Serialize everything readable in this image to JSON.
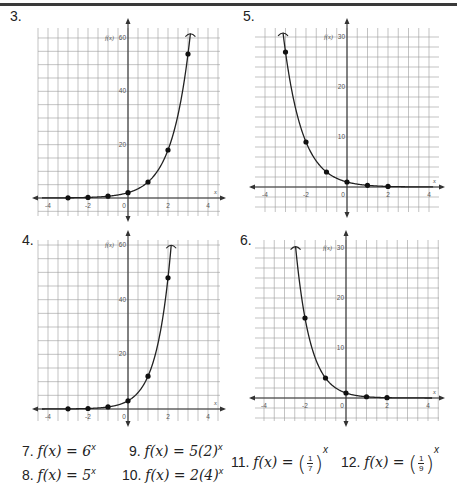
{
  "problems": [
    {
      "num": "3.",
      "label_x": 10,
      "label_y": 10
    },
    {
      "num": "5.",
      "label_x": 243,
      "label_y": 10
    },
    {
      "num": "4.",
      "label_x": 22,
      "label_y": 232
    },
    {
      "num": "6.",
      "label_x": 240,
      "label_y": 232
    }
  ],
  "equations": [
    {
      "num": "7.",
      "lhs": "f(x) = 6",
      "exp": "x"
    },
    {
      "num": "8.",
      "lhs": "f(x) = 5",
      "exp": "x"
    },
    {
      "num": "9.",
      "lhs": "f(x) = 5(2)",
      "exp": "x"
    },
    {
      "num": "10.",
      "lhs": "f(x) = 2(4)",
      "exp": "x"
    },
    {
      "num": "11.",
      "lhs": "f(x) =",
      "frac_num": "1",
      "frac_den": "7",
      "exp": "x"
    },
    {
      "num": "12.",
      "lhs": "f(x) =",
      "frac_num": "1",
      "frac_den": "9",
      "exp": "x"
    }
  ],
  "chart_data": [
    {
      "id": "graph-3",
      "type": "line",
      "title": "3.",
      "xlabel": "x",
      "ylabel": "f(x)",
      "x_ticks": [
        "-4",
        "-2",
        "0",
        "2",
        "4"
      ],
      "y_ticks": [
        "20",
        "40",
        "60"
      ],
      "xlim": [
        -4,
        4
      ],
      "ylim": [
        0,
        60
      ],
      "points": [
        [
          -3,
          0.07
        ],
        [
          -2,
          0.22
        ],
        [
          -1,
          0.67
        ],
        [
          0,
          2
        ],
        [
          1,
          6
        ],
        [
          2,
          18
        ],
        [
          3,
          54
        ]
      ],
      "curve": {
        "a": 2,
        "b": 3
      },
      "box": {
        "left": 38,
        "right": 220,
        "top": 28,
        "bottom": 216,
        "x0": 128,
        "y0": 198,
        "px_per_x": 20,
        "px_per_y": 2.667,
        "grid_dx": 0.5,
        "grid_dy": 5
      }
    },
    {
      "id": "graph-5",
      "type": "line",
      "title": "5.",
      "xlabel": "x",
      "ylabel": "f(x)",
      "x_ticks": [
        "-4",
        "-2",
        "0",
        "2",
        "4"
      ],
      "y_ticks": [
        "10",
        "20",
        "30"
      ],
      "xlim": [
        -4,
        4
      ],
      "ylim": [
        0,
        30
      ],
      "points": [
        [
          -3,
          27
        ],
        [
          -2,
          9
        ],
        [
          -1,
          3
        ],
        [
          0,
          1
        ],
        [
          1,
          0.33
        ],
        [
          2,
          0.11
        ]
      ],
      "curve": {
        "a": 1,
        "b": 0.3333
      },
      "box": {
        "left": 255,
        "right": 439,
        "top": 28,
        "bottom": 212,
        "x0": 347,
        "y0": 187,
        "px_per_x": 20.5,
        "px_per_y": 5,
        "grid_dx": 0.5,
        "grid_dy": 2
      }
    },
    {
      "id": "graph-4",
      "type": "line",
      "title": "4.",
      "xlabel": "x",
      "ylabel": "f(x)",
      "x_ticks": [
        "-4",
        "-2",
        "0",
        "2",
        "4"
      ],
      "y_ticks": [
        "20",
        "40",
        "60"
      ],
      "xlim": [
        -4,
        4
      ],
      "ylim": [
        0,
        60
      ],
      "points": [
        [
          -3,
          0.05
        ],
        [
          -2,
          0.19
        ],
        [
          -1,
          0.75
        ],
        [
          0,
          3
        ],
        [
          1,
          12
        ],
        [
          2,
          48
        ]
      ],
      "curve": {
        "a": 3,
        "b": 4
      },
      "box": {
        "left": 38,
        "right": 220,
        "top": 240,
        "bottom": 421,
        "x0": 128,
        "y0": 409,
        "px_per_x": 20,
        "px_per_y": 2.733,
        "grid_dx": 0.5,
        "grid_dy": 5
      }
    },
    {
      "id": "graph-6",
      "type": "line",
      "title": "6.",
      "xlabel": "x",
      "ylabel": "f(x)",
      "x_ticks": [
        "-4",
        "-2",
        "0",
        "2",
        "4"
      ],
      "y_ticks": [
        "10",
        "20",
        "30"
      ],
      "xlim": [
        -4,
        4
      ],
      "ylim": [
        0,
        30
      ],
      "points": [
        [
          -2,
          16
        ],
        [
          -1,
          4
        ],
        [
          0,
          1
        ],
        [
          1,
          0.25
        ],
        [
          2,
          0.06
        ]
      ],
      "curve": {
        "a": 1,
        "b": 0.25
      },
      "box": {
        "left": 255,
        "right": 439,
        "top": 240,
        "bottom": 421,
        "x0": 346,
        "y0": 398,
        "px_per_x": 20.5,
        "px_per_y": 5,
        "grid_dx": 0.5,
        "grid_dy": 2
      }
    }
  ]
}
